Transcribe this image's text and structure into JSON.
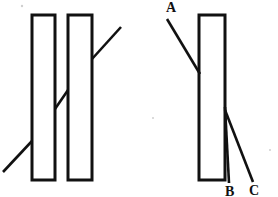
{
  "figure": {
    "kind": "optics-ray-diagram",
    "background_color": "#ffffff",
    "line_color": "#111111",
    "width": 278,
    "height": 197,
    "panels": [
      {
        "id": "left-panel",
        "name": "two-slab-diagram",
        "slabs": [
          {
            "id": "slab-1",
            "x": 32,
            "y": 15,
            "width": 23,
            "height": 165
          },
          {
            "id": "slab-2",
            "x": 68,
            "y": 15,
            "width": 24,
            "height": 165
          }
        ],
        "rays": [
          {
            "id": "incident-ray-lower-left",
            "x1": 3,
            "y1": 172,
            "x2": 32,
            "y2": 141
          },
          {
            "id": "ray-between-slabs",
            "x1": 55,
            "y1": 109,
            "x2": 68,
            "y2": 90
          },
          {
            "id": "emergent-ray-upper-right",
            "x1": 92,
            "y1": 59,
            "x2": 121,
            "y2": 27
          }
        ],
        "labels": []
      },
      {
        "id": "right-panel",
        "name": "single-slab-diagram",
        "slabs": [
          {
            "id": "slab-3",
            "x": 199,
            "y": 15,
            "width": 26,
            "height": 165
          }
        ],
        "rays": [
          {
            "id": "incident-ray-a",
            "x1": 167,
            "y1": 19,
            "x2": 200,
            "y2": 74
          },
          {
            "id": "emergent-ray-b",
            "x1": 225,
            "y1": 107,
            "x2": 229,
            "y2": 183
          },
          {
            "id": "emergent-ray-c",
            "x1": 225,
            "y1": 110,
            "x2": 253,
            "y2": 182
          }
        ],
        "labels": [
          {
            "id": "label-a",
            "text": "A",
            "x": 166,
            "y": 12
          },
          {
            "id": "label-b",
            "text": "B",
            "x": 225,
            "y": 196
          },
          {
            "id": "label-c",
            "text": "C",
            "x": 249,
            "y": 195
          }
        ]
      }
    ],
    "specks": [
      {
        "x": 22,
        "y": 6,
        "r": 1.2
      },
      {
        "x": 153,
        "y": 118,
        "r": 1.0
      },
      {
        "x": 270,
        "y": 150,
        "r": 1.0
      }
    ]
  }
}
